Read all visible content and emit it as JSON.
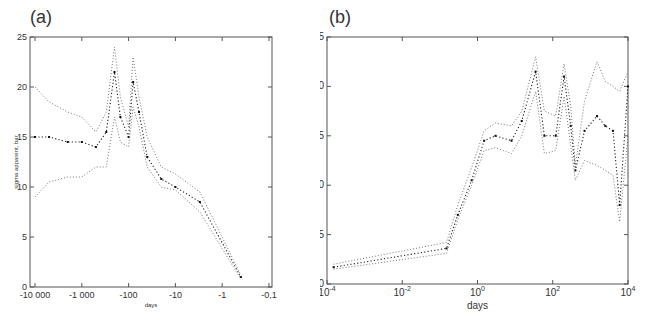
{
  "figure": {
    "panels": [
      {
        "id": "a",
        "label": "(a)"
      },
      {
        "id": "b",
        "label": "(b)"
      }
    ]
  },
  "chart_data": [
    {
      "type": "line",
      "panel": "(a)",
      "title": "",
      "xlabel": "days",
      "ylabel": "sigma apparent, bar",
      "xscale": "log (negative, time before event)",
      "x_tick_labels": [
        "-10 000",
        "-1 000",
        "-100",
        "-10",
        "-1",
        "-0,1"
      ],
      "x_ticks": [
        -10000,
        -1000,
        -100,
        -10,
        -1,
        -0.1
      ],
      "y_tick_labels": [
        "0",
        "5",
        "10",
        "15",
        "20",
        "25"
      ],
      "ylim": [
        0,
        25
      ],
      "grid": false,
      "line_style": "dotted",
      "series": [
        {
          "name": "upper bound",
          "x": [
            -10000,
            -5000,
            -2000,
            -1000,
            -500,
            -300,
            -200,
            -150,
            -100,
            -80,
            -60,
            -40,
            -20,
            -10,
            -3,
            -0.4
          ],
          "y": [
            20,
            18.5,
            17.5,
            17,
            15.5,
            17.5,
            24,
            19,
            16,
            23,
            19,
            15,
            12,
            11.3,
            9.5,
            1.2
          ]
        },
        {
          "name": "estimate",
          "x": [
            -10000,
            -5000,
            -2000,
            -1000,
            -500,
            -300,
            -200,
            -150,
            -100,
            -80,
            -60,
            -40,
            -20,
            -10,
            -3,
            -0.4
          ],
          "y": [
            15,
            15,
            14.5,
            14.5,
            14,
            15.5,
            21.5,
            17,
            15,
            20.5,
            17.5,
            13,
            10.8,
            10,
            8.5,
            1.0
          ]
        },
        {
          "name": "lower bound",
          "x": [
            -10000,
            -5000,
            -2000,
            -1000,
            -500,
            -300,
            -200,
            -150,
            -100,
            -80,
            -60,
            -40,
            -20,
            -10,
            -3,
            -0.4
          ],
          "y": [
            9,
            10.5,
            11,
            11,
            12,
            12,
            17,
            14.5,
            14,
            18,
            16,
            12,
            10,
            9.7,
            7.5,
            0.8
          ]
        }
      ]
    },
    {
      "type": "line",
      "panel": "(b)",
      "title": "",
      "xlabel": "days",
      "ylabel": "sigma apparent, bar",
      "xscale": "log",
      "xlim": [
        0.0001,
        10000
      ],
      "x_tick_labels": [
        "10^-4",
        "10^-2",
        "10^0",
        "10^2",
        "10^4"
      ],
      "x_ticks": [
        0.0001,
        0.01,
        1,
        100,
        10000
      ],
      "y_tick_labels": [
        "0",
        "5",
        "10",
        "15",
        "20",
        "25"
      ],
      "ylim": [
        0,
        25
      ],
      "grid": false,
      "line_style": "dotted",
      "series": [
        {
          "name": "upper bound",
          "x": [
            0.00015,
            0.15,
            0.3,
            0.7,
            1.5,
            3,
            8,
            15,
            35,
            60,
            120,
            200,
            300,
            400,
            700,
            1500,
            2500,
            4000,
            6000,
            10000
          ],
          "y": [
            2,
            4.2,
            8,
            11.8,
            15.5,
            16.3,
            16,
            17.5,
            23,
            17.5,
            17,
            22.3,
            18,
            12,
            18.5,
            22.5,
            20.5,
            20,
            19.5,
            21.5
          ]
        },
        {
          "name": "estimate",
          "x": [
            0.00015,
            0.15,
            0.3,
            0.7,
            1.5,
            3,
            8,
            15,
            35,
            60,
            120,
            200,
            300,
            400,
            700,
            1500,
            2500,
            4000,
            6000,
            10000
          ],
          "y": [
            1.7,
            3.6,
            7,
            10.5,
            14.5,
            15,
            14.5,
            16.5,
            21.5,
            15,
            15,
            21,
            16,
            11.5,
            15.5,
            17,
            16,
            15.5,
            8,
            20
          ]
        },
        {
          "name": "lower bound",
          "x": [
            0.00015,
            0.15,
            0.3,
            0.7,
            1.5,
            3,
            8,
            15,
            35,
            60,
            120,
            200,
            300,
            400,
            700,
            1500,
            2500,
            4000,
            6000,
            10000
          ],
          "y": [
            1.5,
            3.1,
            6.5,
            10,
            13.5,
            13.8,
            13.2,
            15,
            19.5,
            13.2,
            13.5,
            19,
            14,
            10.5,
            12.5,
            12,
            11.5,
            11,
            6.3,
            15
          ]
        }
      ]
    }
  ]
}
